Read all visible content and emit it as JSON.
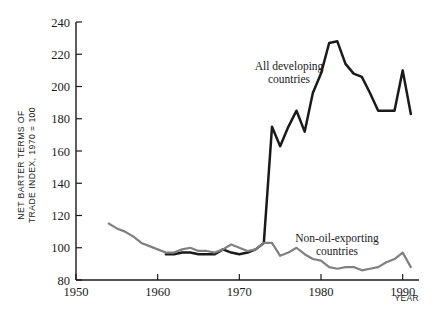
{
  "chart_data": {
    "type": "line",
    "title": "",
    "xlabel": "YEAR",
    "ylabel": "NET BARTER TERMS OF TRADE INDEX, 1970 = 100",
    "ylabel_line1": "NET BARTER TERMS OF",
    "ylabel_line2": "TRADE INDEX, 1970 = 100",
    "xlim": [
      1950,
      1992
    ],
    "ylim": [
      80,
      240
    ],
    "xticks": [
      1950,
      1960,
      1970,
      1980,
      1990
    ],
    "xtick_labels": [
      "1950",
      "1960",
      "1970",
      "1980",
      "1990"
    ],
    "yticks": [
      80,
      100,
      120,
      140,
      160,
      180,
      200,
      220,
      240
    ],
    "ytick_labels": [
      "80",
      "100",
      "120",
      "140",
      "160",
      "180",
      "200",
      "220",
      "240"
    ],
    "grid": false,
    "legend_position": "inline-annotations",
    "series": [
      {
        "name": "All developing countries",
        "color": "#1a1a1a",
        "annotation_line1": "All developing",
        "annotation_line2": "countries",
        "x": [
          1961,
          1962,
          1963,
          1964,
          1965,
          1966,
          1967,
          1968,
          1969,
          1970,
          1971,
          1972,
          1973,
          1974,
          1975,
          1976,
          1977,
          1978,
          1979,
          1980,
          1981,
          1982,
          1983,
          1984,
          1985,
          1986,
          1987,
          1988,
          1989,
          1990,
          1991
        ],
        "values": [
          96,
          96,
          97,
          97,
          96,
          96,
          96,
          99,
          97,
          96,
          97,
          99,
          103,
          175,
          163,
          175,
          185,
          172,
          196,
          208,
          227,
          228,
          214,
          208,
          206,
          196,
          185,
          185,
          185,
          210,
          183
        ]
      },
      {
        "name": "Non-oil-exporting countries",
        "color": "#808080",
        "annotation_line1": "Non-oil-exporting",
        "annotation_line2": "countries",
        "x": [
          1954,
          1955,
          1956,
          1957,
          1958,
          1959,
          1960,
          1961,
          1962,
          1963,
          1964,
          1965,
          1966,
          1967,
          1968,
          1969,
          1970,
          1971,
          1972,
          1973,
          1974,
          1975,
          1976,
          1977,
          1978,
          1979,
          1980,
          1981,
          1982,
          1983,
          1984,
          1985,
          1986,
          1987,
          1988,
          1989,
          1990,
          1991
        ],
        "values": [
          115,
          112,
          110,
          107,
          103,
          101,
          99,
          97,
          97,
          99,
          100,
          98,
          98,
          97,
          99,
          102,
          100,
          98,
          99,
          103,
          103,
          95,
          97,
          100,
          96,
          93,
          92,
          88,
          87,
          88,
          88,
          86,
          87,
          88,
          91,
          93,
          97,
          88
        ]
      }
    ]
  }
}
